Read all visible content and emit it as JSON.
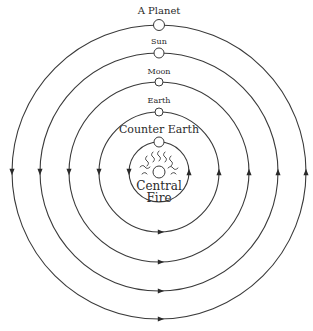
{
  "diagram": {
    "center": {
      "x": 159,
      "y": 172
    },
    "colors": {
      "line": "#3a3a3a",
      "text": "#2a2a2a",
      "background": "#ffffff"
    },
    "orbits": [
      {
        "id": "counter-earth",
        "label": "Counter Earth",
        "radius": 30,
        "body_radius": 5,
        "label_y": 133,
        "label_size": 11
      },
      {
        "id": "earth",
        "label": "Earth",
        "radius": 60,
        "body_radius": 4,
        "label_y": 103,
        "label_size": 8
      },
      {
        "id": "moon",
        "label": "Moon",
        "radius": 90,
        "body_radius": 4,
        "label_y": 74,
        "label_size": 8
      },
      {
        "id": "sun",
        "label": "Sun",
        "radius": 119,
        "body_radius": 5,
        "label_y": 44,
        "label_size": 8
      },
      {
        "id": "a-planet",
        "label": "A Planet",
        "radius": 147,
        "body_radius": 5.5,
        "label_y": 14,
        "label_size": 10
      }
    ],
    "center_body": {
      "label_line1": "Central",
      "label_line2": "Fire",
      "radius": 6
    },
    "arrow_directions": {
      "left": "down",
      "right": "up",
      "bottom": "right"
    }
  }
}
